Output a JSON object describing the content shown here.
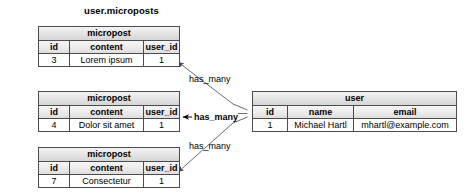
{
  "diagram": {
    "caption": "user.microposts",
    "relationship_labels": [
      {
        "text": "has_many",
        "bold": false
      },
      {
        "text": "has_many",
        "bold": true
      },
      {
        "text": "has_many",
        "bold": false
      }
    ],
    "micropost_tables": [
      {
        "title": "micropost",
        "columns": [
          "id",
          "content",
          "user_id"
        ],
        "row": [
          "3",
          "Lorem ipsum",
          "1"
        ]
      },
      {
        "title": "micropost",
        "columns": [
          "id",
          "content",
          "user_id"
        ],
        "row": [
          "4",
          "Dolor sit amet",
          "1"
        ]
      },
      {
        "title": "micropost",
        "columns": [
          "id",
          "content",
          "user_id"
        ],
        "row": [
          "7",
          "Consectetur",
          "1"
        ]
      }
    ],
    "user_table": {
      "title": "user",
      "columns": [
        "id",
        "name",
        "email"
      ],
      "row": [
        "1",
        "Michael Hartl",
        "mhartl@example.com"
      ]
    },
    "colors": {
      "border": "#4c4c4c",
      "header_fill": "#e2e2e2",
      "background": "#ffffff",
      "line": "#6b6b6b"
    }
  }
}
